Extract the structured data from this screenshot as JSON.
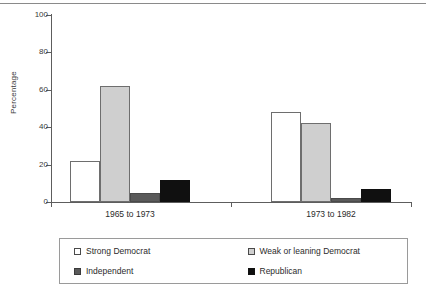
{
  "chart_data": {
    "type": "bar",
    "title": "",
    "xlabel": "",
    "ylabel": "Percentage",
    "ylim": [
      0,
      100
    ],
    "yticks": [
      0,
      20,
      40,
      60,
      80,
      100
    ],
    "ytick_labels": [
      "0",
      "20",
      "40",
      "60",
      "80",
      "100"
    ],
    "grid": false,
    "legend_position": "bottom",
    "categories": [
      "1965 to 1973",
      "1973 to 1982"
    ],
    "series": [
      {
        "name": "Strong Democrat",
        "color": "#ffffff",
        "values": [
          22,
          48
        ]
      },
      {
        "name": "Weak or leaning Democrat",
        "color": "#cfcfcf",
        "values": [
          62,
          42
        ]
      },
      {
        "name": "Independent",
        "color": "#5a5a5a",
        "values": [
          5,
          2
        ]
      },
      {
        "name": "Republican",
        "color": "#101010",
        "values": [
          12,
          7
        ]
      }
    ]
  },
  "legend": {
    "items": [
      {
        "label": "Strong Democrat",
        "swatch": "strong-democrat"
      },
      {
        "label": "Weak or leaning Democrat",
        "swatch": "weak-democrat"
      },
      {
        "label": "Independent",
        "swatch": "independent"
      },
      {
        "label": "Republican",
        "swatch": "republican"
      }
    ]
  }
}
